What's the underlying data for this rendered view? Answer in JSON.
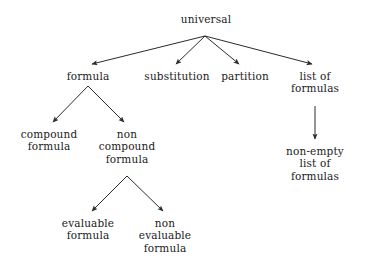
{
  "diagram": {
    "type": "tree",
    "background_color": "#ffffff",
    "text_color": "#1a1a1a",
    "edge_color": "#2b2b2b",
    "nodes": [
      {
        "id": "universal",
        "lines": [
          "universal"
        ],
        "x": 206,
        "y": 13
      },
      {
        "id": "formula",
        "lines": [
          "formula"
        ],
        "x": 88,
        "y": 70
      },
      {
        "id": "substitution",
        "lines": [
          "substitution"
        ],
        "x": 177,
        "y": 70
      },
      {
        "id": "partition",
        "lines": [
          "partition"
        ],
        "x": 245,
        "y": 70
      },
      {
        "id": "list-of-formulas",
        "lines": [
          "list of",
          "formulas"
        ],
        "x": 315,
        "y": 70
      },
      {
        "id": "compound-formula",
        "lines": [
          "compound",
          "formula"
        ],
        "x": 49,
        "y": 128
      },
      {
        "id": "non-compound-formula",
        "lines": [
          "non",
          "compound",
          "formula"
        ],
        "x": 127,
        "y": 128
      },
      {
        "id": "non-empty-list",
        "lines": [
          "non-empty",
          "list of",
          "formulas"
        ],
        "x": 315,
        "y": 145
      },
      {
        "id": "evaluable-formula",
        "lines": [
          "evaluable",
          "formula"
        ],
        "x": 88,
        "y": 217
      },
      {
        "id": "non-evaluable-formula",
        "lines": [
          "non",
          "evaluable",
          "formula"
        ],
        "x": 165,
        "y": 217
      }
    ],
    "edges": [
      {
        "id": "universal-to-formula",
        "from": "universal",
        "to": "formula",
        "x1": 205,
        "y1": 36,
        "x2": 92,
        "y2": 64
      },
      {
        "id": "universal-to-substitution",
        "from": "universal",
        "to": "substitution",
        "x1": 205,
        "y1": 36,
        "x2": 176,
        "y2": 64
      },
      {
        "id": "universal-to-partition",
        "from": "universal",
        "to": "partition",
        "x1": 205,
        "y1": 36,
        "x2": 239,
        "y2": 64
      },
      {
        "id": "universal-to-list-of-formulas",
        "from": "universal",
        "to": "list-of-formulas",
        "x1": 205,
        "y1": 36,
        "x2": 312,
        "y2": 64
      },
      {
        "id": "formula-to-compound",
        "from": "formula",
        "to": "compound-formula",
        "x1": 88,
        "y1": 86,
        "x2": 53,
        "y2": 122
      },
      {
        "id": "formula-to-non-compound",
        "from": "formula",
        "to": "non-compound-formula",
        "x1": 88,
        "y1": 86,
        "x2": 124,
        "y2": 122
      },
      {
        "id": "list-to-non-empty-list",
        "from": "list-of-formulas",
        "to": "non-empty-list",
        "x1": 315,
        "y1": 106,
        "x2": 315,
        "y2": 139
      },
      {
        "id": "non-compound-to-evaluable",
        "from": "non-compound-formula",
        "to": "evaluable-formula",
        "x1": 127,
        "y1": 176,
        "x2": 92,
        "y2": 211
      },
      {
        "id": "non-compound-to-non-evaluable",
        "from": "non-compound-formula",
        "to": "non-evaluable-formula",
        "x1": 127,
        "y1": 176,
        "x2": 163,
        "y2": 211
      }
    ]
  }
}
